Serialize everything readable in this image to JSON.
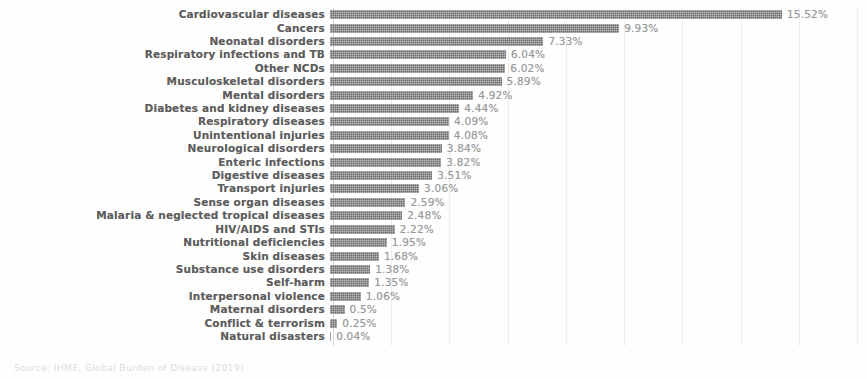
{
  "source_note": "Source: IHME, Global Burden of Disease (2019)",
  "chart_data": {
    "type": "bar",
    "orientation": "horizontal",
    "title": "",
    "subtitle": "",
    "xlabel": "",
    "ylabel": "",
    "xlim": [
      0,
      18
    ],
    "gridlines": [
      2,
      4,
      6,
      8,
      10,
      12,
      14,
      16,
      18
    ],
    "grid": true,
    "legend": "none",
    "value_suffix": "%",
    "bar_color": "#6e6e6e",
    "label_color": "#5e5e5e",
    "value_color": "#9a9a9a",
    "grid_color": "#ededed",
    "categories": [
      "Cardiovascular diseases",
      "Cancers",
      "Neonatal disorders",
      "Respiratory infections and TB",
      "Other NCDs",
      "Musculoskeletal disorders",
      "Mental disorders",
      "Diabetes and kidney diseases",
      "Respiratory diseases",
      "Unintentional injuries",
      "Neurological disorders",
      "Enteric infections",
      "Digestive diseases",
      "Transport injuries",
      "Sense organ diseases",
      "Malaria & neglected tropical diseases",
      "HIV/AIDS and STIs",
      "Nutritional deficiencies",
      "Skin diseases",
      "Substance use disorders",
      "Self-harm",
      "Interpersonal violence",
      "Maternal disorders",
      "Conflict & terrorism",
      "Natural disasters"
    ],
    "values": [
      15.52,
      9.93,
      7.33,
      6.04,
      6.02,
      5.89,
      4.92,
      4.44,
      4.09,
      4.08,
      3.84,
      3.82,
      3.51,
      3.06,
      2.59,
      2.48,
      2.22,
      1.95,
      1.68,
      1.38,
      1.35,
      1.06,
      0.5,
      0.25,
      0.04
    ],
    "value_labels": [
      "15.52%",
      "9.93%",
      "7.33%",
      "6.04%",
      "6.02%",
      "5.89%",
      "4.92%",
      "4.44%",
      "4.09%",
      "4.08%",
      "3.84%",
      "3.82%",
      "3.51%",
      "3.06%",
      "2.59%",
      "2.48%",
      "2.22%",
      "1.95%",
      "1.68%",
      "1.38%",
      "1.35%",
      "1.06%",
      "0.5%",
      "0.25%",
      "0.04%"
    ]
  }
}
